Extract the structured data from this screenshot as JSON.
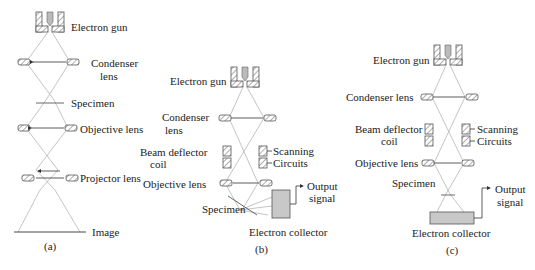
{
  "panel_a": {
    "caption": "(a)",
    "labels": {
      "electron_gun": "Electron gun",
      "condenser_lens_1": "Condenser",
      "condenser_lens_2": "lens",
      "specimen": "Specimen",
      "objective_lens": "Objective lens",
      "projector_lens": "Projector lens",
      "image": "Image"
    }
  },
  "panel_b": {
    "caption": "(b)",
    "labels": {
      "electron_gun": "Electron gun",
      "condenser_lens_1": "Condenser",
      "condenser_lens_2": "lens",
      "beam_deflector_1": "Beam deflector",
      "beam_deflector_2": "coil",
      "scanning": "Scanning",
      "circuits": "Circuits",
      "objective_lens": "Objective lens",
      "specimen": "Specimen",
      "output_1": "Output",
      "output_2": "signal",
      "electron_collector": "Electron collector"
    }
  },
  "panel_c": {
    "caption": "(c)",
    "labels": {
      "electron_gun": "Electron gun",
      "condenser_lens": "Condenser lens",
      "beam_deflector_1": "Beam deflector",
      "beam_deflector_2": "coil",
      "scanning": "Scanning",
      "circuits": "Circuits",
      "objective_lens": "Objective lens",
      "specimen": "Specimen",
      "output_1": "Output",
      "output_2": "signal",
      "electron_collector": "Electron collector"
    }
  },
  "colors": {
    "line": "#444444",
    "ray": "#aaaaaa",
    "fill_gray": "#c8c8c8"
  }
}
